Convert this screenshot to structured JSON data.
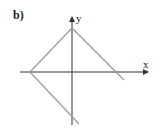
{
  "figure": {
    "part_label": "b)",
    "axes": {
      "x_label": "x",
      "y_label": "y"
    },
    "colors": {
      "axes": "#333333",
      "graph": "#999999"
    }
  }
}
